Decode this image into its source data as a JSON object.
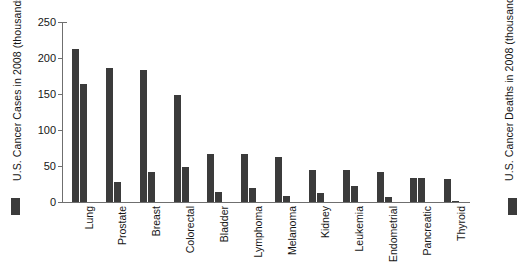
{
  "chart_data": {
    "type": "bar",
    "title": "",
    "subtitle": "",
    "xlabel": "",
    "ylabel": "U.S. Cancer Cases in 2008 (thousands)",
    "y2label": "U.S. Cancer Deaths in 2008 (thousands)",
    "ylim": [
      0,
      250
    ],
    "y2lim": [
      0,
      250
    ],
    "yticks": [
      0,
      50,
      100,
      150,
      200,
      250
    ],
    "ytick_labels": [
      "0",
      "50",
      "100",
      "150",
      "200",
      "250"
    ],
    "grid": false,
    "legend_position": "outside-left-and-right",
    "bar_color": "#3b3b3b",
    "categories": [
      "Lung",
      "Prostate",
      "Breast",
      "Colorectal",
      "Bladder",
      "Lymphoma",
      "Melanoma",
      "Kidney",
      "Leukemia",
      "Endometrial",
      "Pancreatic",
      "Thyroid"
    ],
    "series": [
      {
        "name": "U.S. Cancer Cases in 2008 (thousands)",
        "axis": "left",
        "color": "#3b3b3b",
        "values": [
          212,
          186,
          184,
          148,
          67,
          66,
          62,
          45,
          44,
          42,
          34,
          32
        ]
      },
      {
        "name": "U.S. Cancer Deaths in 2008 (thousands)",
        "axis": "right",
        "color": "#3b3b3b",
        "values": [
          164,
          28,
          41,
          49,
          14,
          19,
          8,
          13,
          22,
          7,
          33,
          2
        ]
      }
    ]
  },
  "legend": {
    "left_swatch_name": "cases-swatch",
    "right_swatch_name": "deaths-swatch"
  }
}
